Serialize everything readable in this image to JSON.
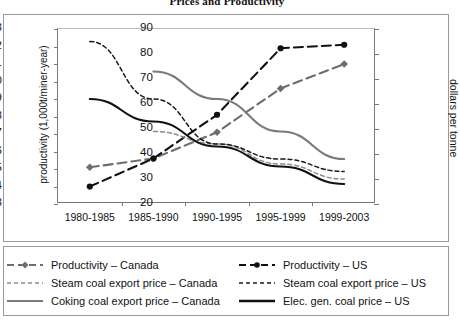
{
  "chart_data": {
    "type": "line",
    "title": "Prices and Productivity",
    "xlabel": "",
    "ylabel": "productivity (1,000t/miner-year)",
    "y2label": "dollars per tonne",
    "categories": [
      "1980-1985",
      "1985-1990",
      "1990-1995",
      "1995-1999",
      "1999-2003"
    ],
    "ylim": [
      3,
      13
    ],
    "yticks": [
      3,
      4,
      5,
      6,
      7,
      8,
      9,
      10,
      11,
      12,
      13
    ],
    "y2lim": [
      20,
      90
    ],
    "y2ticks": [
      20,
      30,
      40,
      50,
      60,
      70,
      80,
      90
    ],
    "grid": false,
    "legend_position": "bottom",
    "series": [
      {
        "name": "Productivity – Canada",
        "axis": "left",
        "color": "#6d6d6d",
        "style": "dashed",
        "marker": "diamond",
        "values": [
          5.1,
          5.6,
          7.1,
          9.6,
          11.0
        ]
      },
      {
        "name": "Productivity – US",
        "axis": "left",
        "color": "#111111",
        "style": "dashed",
        "marker": "circle",
        "values": [
          4.0,
          5.6,
          8.1,
          11.9,
          12.1
        ]
      },
      {
        "name": "Steam coal export price – Canada",
        "axis": "right",
        "color": "#8c8c8c",
        "style": "fine-dashed",
        "marker": "none",
        "values": [
          null,
          49,
          44,
          36,
          30
        ]
      },
      {
        "name": "Steam coal export price – US",
        "axis": "right",
        "color": "#1a1a1a",
        "style": "fine-dashed",
        "marker": "none",
        "values": [
          85,
          62,
          44,
          38,
          33
        ]
      },
      {
        "name": "Coking coal export price – Canada",
        "axis": "right",
        "color": "#7a7a7a",
        "style": "solid",
        "marker": "none",
        "values": [
          null,
          73,
          62,
          49,
          38
        ]
      },
      {
        "name": "Elec. gen. coal price – US",
        "axis": "right",
        "color": "#111111",
        "style": "solid",
        "marker": "none",
        "values": [
          62,
          53,
          43,
          35,
          28
        ]
      }
    ]
  },
  "legend": {
    "items": [
      {
        "label": "Productivity – Canada",
        "swatch": "dashed-diamond-gray"
      },
      {
        "label": "Productivity – US",
        "swatch": "dashed-circle-black"
      },
      {
        "label": "Steam coal export price – Canada",
        "swatch": "fine-dashed-gray"
      },
      {
        "label": "Steam coal export price – US",
        "swatch": "fine-dashed-black"
      },
      {
        "label": "Coking coal export price – Canada",
        "swatch": "solid-gray"
      },
      {
        "label": "Elec. gen. coal price – US",
        "swatch": "solid-black"
      }
    ]
  }
}
